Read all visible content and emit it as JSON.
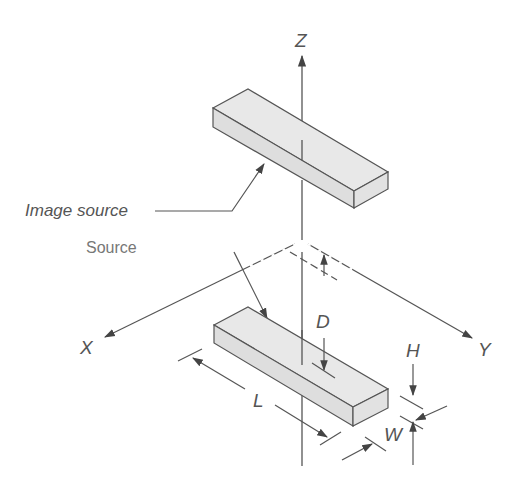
{
  "diagram": {
    "type": "image-source geometry (3D axes)",
    "axes": {
      "z_label": "Z",
      "x_label": "X",
      "y_label": "Y"
    },
    "labels": {
      "image_source": "Image source",
      "source": "Source",
      "distance": "D",
      "length": "L",
      "height": "H",
      "width": "W"
    },
    "colors": {
      "line": "#555555",
      "box_fill": "#e6e6e6",
      "box_side": "#dcdcdc",
      "text": "#555555",
      "faded_text": "#777777"
    }
  }
}
